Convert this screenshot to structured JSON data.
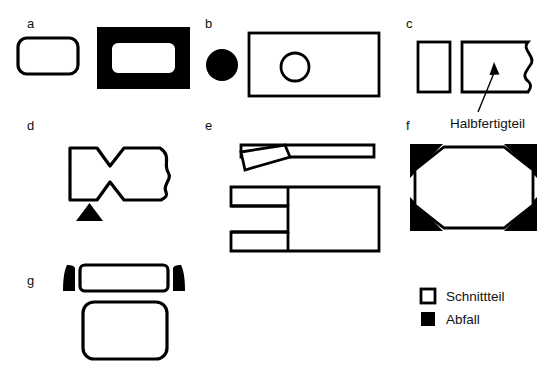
{
  "figure": {
    "background_color": "#ffffff",
    "line_color": "#000000",
    "waste_color": "#000000",
    "part_fill_color": "#ffffff"
  },
  "panels": [
    {
      "key": "a",
      "label": "a"
    },
    {
      "key": "b",
      "label": "b"
    },
    {
      "key": "c",
      "label": "c"
    },
    {
      "key": "d",
      "label": "d"
    },
    {
      "key": "e",
      "label": "e"
    },
    {
      "key": "f",
      "label": "f"
    },
    {
      "key": "g",
      "label": "g"
    }
  ],
  "annotations": [
    {
      "key": "halbfertigteil",
      "text": "Halbfertigteil"
    }
  ],
  "legend": {
    "items": [
      {
        "key": "schnittteil",
        "label": "Schnittteil",
        "swatch": "outline",
        "color": "#ffffff"
      },
      {
        "key": "abfall",
        "label": "Abfall",
        "swatch": "filled",
        "color": "#000000"
      }
    ]
  }
}
